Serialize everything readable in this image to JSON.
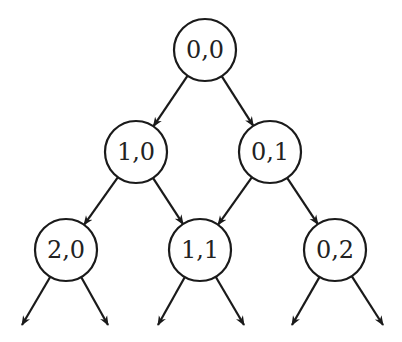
{
  "diagram": {
    "type": "tree",
    "stroke_color": "#1a1a1a",
    "nodes": [
      {
        "id": "n00",
        "label": "0,0",
        "x": 205,
        "y": 50
      },
      {
        "id": "n10",
        "label": "1,0",
        "x": 136,
        "y": 152
      },
      {
        "id": "n01",
        "label": "0,1",
        "x": 270,
        "y": 152
      },
      {
        "id": "n20",
        "label": "2,0",
        "x": 66,
        "y": 250
      },
      {
        "id": "n11",
        "label": "1,1",
        "x": 200,
        "y": 250
      },
      {
        "id": "n02",
        "label": "0,2",
        "x": 335,
        "y": 250
      }
    ],
    "edges": [
      {
        "from": "n00",
        "to": "n10"
      },
      {
        "from": "n00",
        "to": "n01"
      },
      {
        "from": "n10",
        "to": "n20"
      },
      {
        "from": "n10",
        "to": "n11"
      },
      {
        "from": "n01",
        "to": "n11"
      },
      {
        "from": "n01",
        "to": "n02"
      },
      {
        "from": "n20",
        "to": "out1"
      },
      {
        "from": "n20",
        "to": "out2"
      },
      {
        "from": "n11",
        "to": "out3"
      },
      {
        "from": "n11",
        "to": "out4"
      },
      {
        "from": "n02",
        "to": "out5"
      },
      {
        "from": "n02",
        "to": "out6"
      }
    ]
  }
}
